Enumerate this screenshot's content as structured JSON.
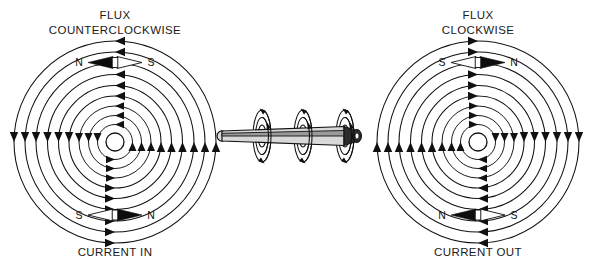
{
  "figure": {
    "background_color": "#ffffff",
    "line_color": "#111111",
    "width": 592,
    "height": 268
  },
  "left_panel": {
    "title_line1": "FLUX",
    "title_line2": "COUNTERCLOCKWISE",
    "bottom_label": "CURRENT IN",
    "flux_direction": "counterclockwise",
    "current_direction": "into the page",
    "center": {
      "x": 115,
      "y": 142
    },
    "ring_count": 10,
    "ring_radii": [
      9,
      17.5,
      26.5,
      36,
      46,
      56.5,
      67.5,
      79,
      90,
      101
    ],
    "hub_radius": 9,
    "top_compass": {
      "north_label": "N",
      "south_label": "S",
      "north_side": "left",
      "south_side": "right",
      "dark_end": "left"
    },
    "bottom_compass": {
      "north_label": "N",
      "south_label": "S",
      "north_side": "right",
      "south_side": "left",
      "dark_end": "right"
    },
    "arrowheads": {
      "top": "left",
      "bottom": "right",
      "left_flank": "down",
      "right_flank": "up"
    }
  },
  "right_panel": {
    "title_line1": "FLUX",
    "title_line2": "CLOCKWISE",
    "bottom_label": "CURRENT OUT",
    "flux_direction": "clockwise",
    "current_direction": "out of the page",
    "center": {
      "x": 478,
      "y": 142
    },
    "ring_count": 10,
    "ring_radii": [
      9,
      17.5,
      26.5,
      36,
      46,
      56.5,
      67.5,
      79,
      90,
      101
    ],
    "hub_radius": 9,
    "top_compass": {
      "north_label": "N",
      "south_label": "S",
      "north_side": "right",
      "south_side": "left",
      "dark_end": "right"
    },
    "bottom_compass": {
      "north_label": "N",
      "south_label": "S",
      "north_side": "left",
      "south_side": "right",
      "dark_end": "left"
    },
    "arrowheads": {
      "top": "right",
      "bottom": "left",
      "left_flank": "up",
      "right_flank": "down"
    }
  },
  "center_panel": {
    "description": "three-dimensional conductor with circular magnetic flux rings",
    "wire_axis_y": 136,
    "wire_start_x": 218,
    "wire_end_x": 360,
    "ring_cluster_count": 3,
    "ring_cluster_x": [
      262,
      303,
      345
    ],
    "rings_per_cluster": 3,
    "wire_tip": "right",
    "wire_tail": "left"
  }
}
